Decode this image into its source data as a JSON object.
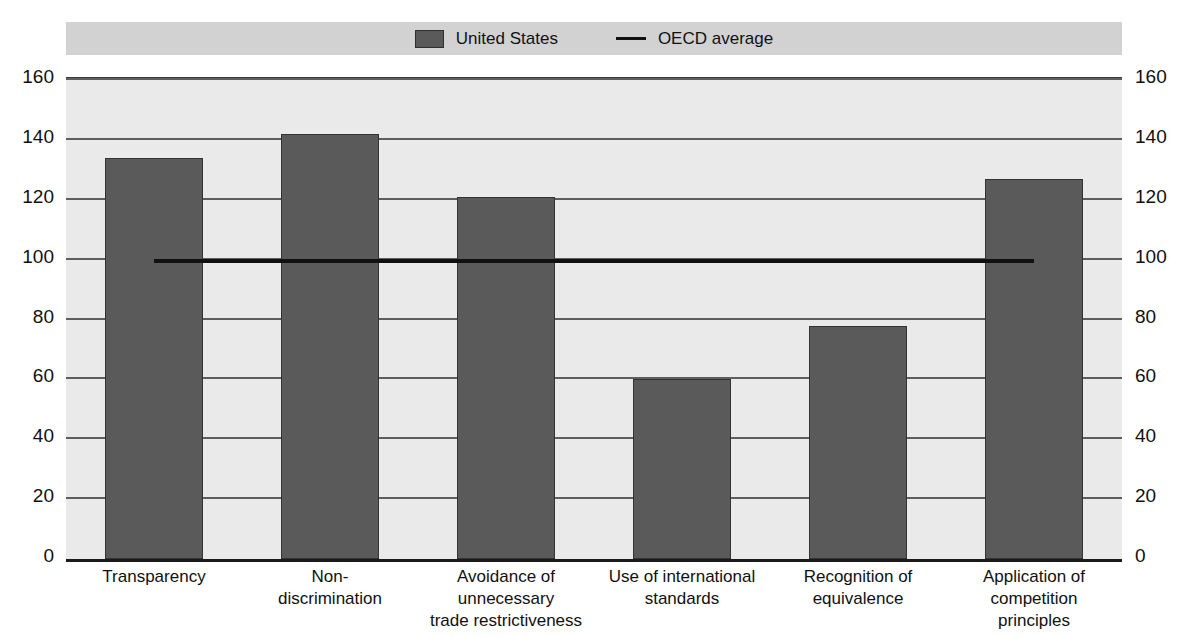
{
  "chart_data": {
    "type": "bar",
    "title": "",
    "xlabel": "",
    "ylabel": "",
    "ylim": [
      0,
      160
    ],
    "yticks": [
      0,
      20,
      40,
      60,
      80,
      100,
      120,
      140,
      160
    ],
    "grid": true,
    "legend_position": "top-center",
    "categories": [
      "Transparency",
      "Non-\ndiscrimination",
      "Avoidance of\nunnecessary\ntrade restrictiveness",
      "Use of international\nstandards",
      "Recognition of\nequivalence",
      "Application of\ncompetition\nprinciples"
    ],
    "series": [
      {
        "name": "United States",
        "type": "bar",
        "color": "#5a5a5a",
        "values": [
          134,
          142,
          121,
          60,
          78,
          127
        ]
      },
      {
        "name": "OECD average",
        "type": "line",
        "color": "#111111",
        "value": 99
      }
    ]
  },
  "legend": {
    "items": [
      {
        "label": "United States",
        "marker": "square-swatch"
      },
      {
        "label": "OECD average",
        "marker": "line-swatch"
      }
    ]
  },
  "axes": {
    "y_left_labels": [
      "160",
      "140",
      "120",
      "100",
      "80",
      "60",
      "40",
      "20",
      "0"
    ],
    "y_right_labels": [
      "160",
      "140",
      "120",
      "100",
      "80",
      "60",
      "40",
      "20",
      "0"
    ]
  }
}
